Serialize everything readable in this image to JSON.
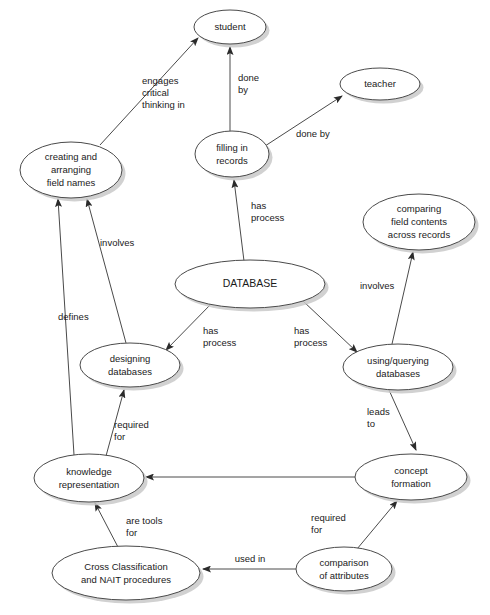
{
  "diagram": {
    "type": "concept-map",
    "background_color": "#ffffff",
    "node_fill": "#ffffff",
    "node_stroke": "#4a4a4a",
    "edge_stroke": "#4a4a4a",
    "text_color": "#1a1a1a",
    "nodes": [
      {
        "id": "student",
        "lines": [
          "student"
        ],
        "cx": 230,
        "cy": 27,
        "rx": 36,
        "ry": 17
      },
      {
        "id": "teacher",
        "lines": [
          "teacher"
        ],
        "cx": 380,
        "cy": 84,
        "rx": 40,
        "ry": 16
      },
      {
        "id": "filling-in-records",
        "lines": [
          "filling in",
          "records"
        ],
        "cx": 232,
        "cy": 154,
        "rx": 37,
        "ry": 23
      },
      {
        "id": "creating-and-arranging-field-names",
        "lines": [
          "creating and",
          "arranging",
          "field names"
        ],
        "cx": 71,
        "cy": 170,
        "rx": 51,
        "ry": 28
      },
      {
        "id": "comparing-field-contents-across-records",
        "lines": [
          "comparing",
          "field contents",
          "across records"
        ],
        "cx": 419,
        "cy": 222,
        "rx": 56,
        "ry": 28
      },
      {
        "id": "database",
        "lines": [
          "DATABASE"
        ],
        "cx": 250,
        "cy": 284,
        "rx": 75,
        "ry": 24
      },
      {
        "id": "designing-databases",
        "lines": [
          "designing",
          "databases"
        ],
        "cx": 130,
        "cy": 365,
        "rx": 50,
        "ry": 22
      },
      {
        "id": "using-querying-databases",
        "lines": [
          "using/querying",
          "databases"
        ],
        "cx": 398,
        "cy": 367,
        "rx": 55,
        "ry": 23
      },
      {
        "id": "knowledge-representation",
        "lines": [
          "knowledge",
          "representation"
        ],
        "cx": 89,
        "cy": 478,
        "rx": 55,
        "ry": 24
      },
      {
        "id": "concept-formation",
        "lines": [
          "concept",
          "formation"
        ],
        "cx": 411,
        "cy": 477,
        "rx": 56,
        "ry": 23
      },
      {
        "id": "cross-classification-and-nait-procedures",
        "lines": [
          "Cross Classification",
          "and NAIT procedures"
        ],
        "cx": 126,
        "cy": 573,
        "rx": 74,
        "ry": 27
      },
      {
        "id": "comparison-of-attributes",
        "lines": [
          "comparison",
          "of attributes"
        ],
        "cx": 344,
        "cy": 569,
        "rx": 48,
        "ry": 22
      }
    ],
    "edges": [
      {
        "id": "creating-engages-student",
        "from": "creating-and-arranging-field-names",
        "to": "student",
        "label_lines": [
          "engages",
          "critical",
          "thinking in"
        ],
        "x1": 100,
        "y1": 145,
        "x2": 198,
        "y2": 38,
        "label_x": 142,
        "label_y": 84,
        "label_anchor": "start"
      },
      {
        "id": "filling-done-by-student",
        "from": "filling-in-records",
        "to": "student",
        "label_lines": [
          "done",
          "by"
        ],
        "x1": 230,
        "y1": 131,
        "x2": 230,
        "y2": 47,
        "label_x": 238,
        "label_y": 81,
        "label_anchor": "start"
      },
      {
        "id": "filling-done-by-teacher",
        "from": "filling-in-records",
        "to": "teacher",
        "label_lines": [
          "done by"
        ],
        "x1": 265,
        "y1": 146,
        "x2": 342,
        "y2": 96,
        "label_x": 296,
        "label_y": 137,
        "label_anchor": "start"
      },
      {
        "id": "database-has-process-filling",
        "from": "database",
        "to": "filling-in-records",
        "label_lines": [
          "has",
          "process"
        ],
        "x1": 244,
        "y1": 261,
        "x2": 234,
        "y2": 180,
        "label_x": 251,
        "label_y": 209,
        "label_anchor": "start"
      },
      {
        "id": "database-has-process-designing",
        "from": "database",
        "to": "designing-databases",
        "label_lines": [
          "has",
          "process"
        ],
        "x1": 212,
        "y1": 303,
        "x2": 166,
        "y2": 350,
        "label_x": 203,
        "label_y": 334,
        "label_anchor": "start"
      },
      {
        "id": "database-has-process-using",
        "from": "database",
        "to": "using-querying-databases",
        "label_lines": [
          "has",
          "process"
        ],
        "x1": 303,
        "y1": 301,
        "x2": 357,
        "y2": 352,
        "label_x": 294,
        "label_y": 334,
        "label_anchor": "start"
      },
      {
        "id": "using-involves-comparing",
        "from": "using-querying-databases",
        "to": "comparing-field-contents-across-records",
        "label_lines": [
          "involves"
        ],
        "x1": 392,
        "y1": 344,
        "x2": 413,
        "y2": 252,
        "label_x": 360,
        "label_y": 289,
        "label_anchor": "start"
      },
      {
        "id": "designing-involves-creating",
        "from": "designing-databases",
        "to": "creating-and-arranging-field-names",
        "label_lines": [
          "involves"
        ],
        "x1": 126,
        "y1": 343,
        "x2": 87,
        "y2": 199,
        "label_x": 100,
        "label_y": 246,
        "label_anchor": "start"
      },
      {
        "id": "knowledge-defines-creating",
        "from": "knowledge-representation",
        "to": "creating-and-arranging-field-names",
        "label_lines": [
          "defines"
        ],
        "x1": 74,
        "y1": 455,
        "x2": 58,
        "y2": 199,
        "label_x": 58,
        "label_y": 320,
        "label_anchor": "start"
      },
      {
        "id": "knowledge-required-for-designing",
        "from": "knowledge-representation",
        "to": "designing-databases",
        "label_lines": [
          "required",
          "for"
        ],
        "x1": 106,
        "y1": 456,
        "x2": 124,
        "y2": 390,
        "label_x": 114,
        "label_y": 428,
        "label_anchor": "start"
      },
      {
        "id": "using-leads-to-concept",
        "from": "using-querying-databases",
        "to": "concept-formation",
        "label_lines": [
          "leads",
          "to"
        ],
        "x1": 389,
        "y1": 390,
        "x2": 416,
        "y2": 450,
        "label_x": 367,
        "label_y": 415,
        "label_anchor": "start"
      },
      {
        "id": "concept-to-knowledge",
        "from": "concept-formation",
        "to": "knowledge-representation",
        "label_lines": [],
        "x1": 355,
        "y1": 477,
        "x2": 146,
        "y2": 477,
        "label_x": 250,
        "label_y": 470,
        "label_anchor": "middle"
      },
      {
        "id": "cross-are-tools-for-knowledge",
        "from": "cross-classification-and-nait-procedures",
        "to": "knowledge-representation",
        "label_lines": [
          "are tools",
          "for"
        ],
        "x1": 119,
        "y1": 549,
        "x2": 95,
        "y2": 503,
        "label_x": 126,
        "label_y": 524,
        "label_anchor": "start"
      },
      {
        "id": "comparison-used-in-cross",
        "from": "comparison-of-attributes",
        "to": "cross-classification-and-nait-procedures",
        "label_lines": [
          "used in"
        ],
        "x1": 296,
        "y1": 569,
        "x2": 203,
        "y2": 569,
        "label_x": 250,
        "label_y": 562,
        "label_anchor": "middle"
      },
      {
        "id": "comparison-required-for-concept",
        "from": "comparison-of-attributes",
        "to": "concept-formation",
        "label_lines": [
          "required",
          "for"
        ],
        "x1": 357,
        "y1": 549,
        "x2": 397,
        "y2": 501,
        "label_x": 311,
        "label_y": 521,
        "label_anchor": "start"
      }
    ]
  }
}
